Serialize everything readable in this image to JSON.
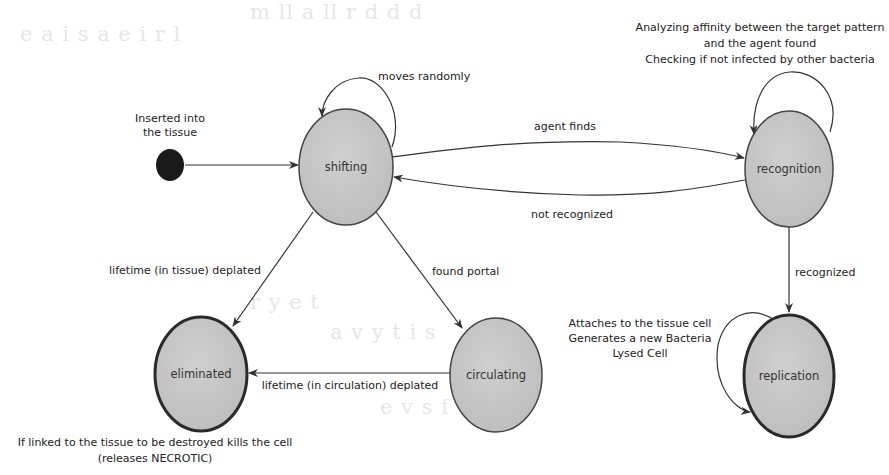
{
  "diagram": {
    "type": "uml-state-machine",
    "initial": {
      "label_line1": "Inserted into",
      "label_line2": "the tissue"
    },
    "states": {
      "shifting": "shifting",
      "recognition": "recognition",
      "eliminated": "eliminated",
      "circulating": "circulating",
      "replication": "replication"
    },
    "transitions": {
      "moves_randomly": "moves randomly",
      "agent_finds": "agent finds",
      "not_recognized": "not recognized",
      "recognized": "recognized",
      "lifetime_tissue": "lifetime (in tissue) deplated",
      "found_portal": "found portal",
      "lifetime_circulation": "lifetime (in circulation) deplated"
    },
    "notes": {
      "recognition_self_1": "Analyzing affinity between the target pattern",
      "recognition_self_2": "and the agent found",
      "recognition_self_3": "Checking if not infected by other bacteria",
      "replication_self_1": "Attaches to the tissue cell",
      "replication_self_2": "Generates a new Bacteria",
      "replication_self_3": "Lysed Cell",
      "eliminated_1": "If linked to the tissue to be destroyed kills the cell",
      "eliminated_2": "(releases NECROTIC)"
    },
    "colors": {
      "node_fill": "#c4c4c4",
      "node_stroke": "#3a3a3a",
      "initial_fill": "#1a1a1a",
      "edge": "#333333"
    }
  }
}
